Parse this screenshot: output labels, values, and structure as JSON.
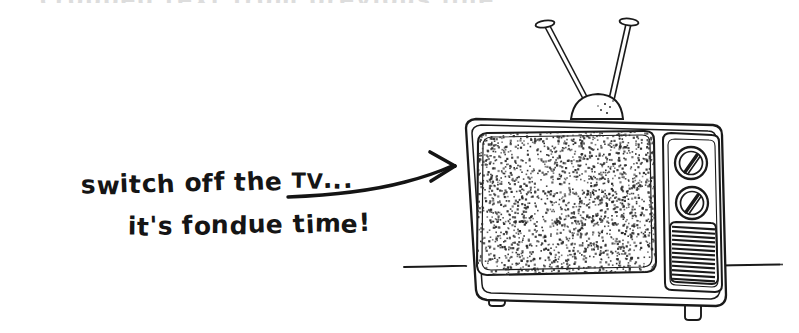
{
  "page": {
    "title": "switch off the TV... it's fondue time!",
    "background_color": "#ffffff",
    "ink_color": "#1a1a1a",
    "width": 799,
    "height": 333
  },
  "caption": {
    "line1": "switch off the ",
    "line1_acronym": "TV",
    "line1_ellipsis": "...",
    "line2": "it's fondue time!",
    "full_text": "switch off the TV... it's fondue time!"
  },
  "ghost_row": {
    "text": "cropped text from previous line"
  },
  "arrow": {
    "name": "curved-pointer-arrow",
    "direction": "right-up",
    "points_to": "television"
  },
  "illustration": {
    "subject": "retro-crt-television",
    "style": "hand-drawn ink line art",
    "parts": [
      {
        "name": "antenna-rod-left",
        "label": "left rabbit-ear antenna rod"
      },
      {
        "name": "antenna-rod-right",
        "label": "right rabbit-ear antenna rod"
      },
      {
        "name": "antenna-tip-left",
        "label": "left antenna tip cap"
      },
      {
        "name": "antenna-tip-right",
        "label": "right antenna tip cap"
      },
      {
        "name": "antenna-base-dome",
        "label": "antenna base dome"
      },
      {
        "name": "tv-cabinet",
        "label": "television cabinet"
      },
      {
        "name": "tv-screen",
        "label": "screen showing static"
      },
      {
        "name": "tv-screen-static",
        "label": "television static noise"
      },
      {
        "name": "tv-knob-upper",
        "label": "upper control knob"
      },
      {
        "name": "tv-knob-lower",
        "label": "lower control knob"
      },
      {
        "name": "tv-speaker-grille",
        "label": "speaker grille"
      },
      {
        "name": "tv-foot-left",
        "label": "left foot"
      },
      {
        "name": "tv-foot-right",
        "label": "right foot"
      },
      {
        "name": "ground-line",
        "label": "surface line"
      }
    ],
    "speaker_grille_lines": 13
  }
}
